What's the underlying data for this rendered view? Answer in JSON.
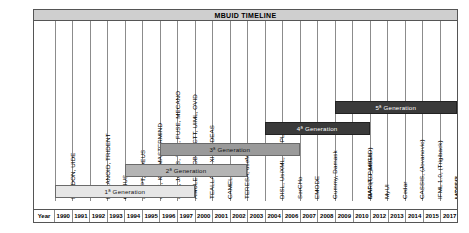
{
  "title": "MBUID TIMELINE",
  "axis": {
    "caption": "Year",
    "years": [
      "1990",
      "1991",
      "1992",
      "1993",
      "1994",
      "1995",
      "1996",
      "1997",
      "2000",
      "2001",
      "2002",
      "2003",
      "2004",
      "2006",
      "2007",
      "2008",
      "2009",
      "2010",
      "2012",
      "2013",
      "2014",
      "2015",
      "2017"
    ]
  },
  "chart_data": {
    "type": "table",
    "title": "MBUID TIMELINE",
    "xlabel": "Year",
    "ylabel": "",
    "grid": true,
    "legend_position": "none",
    "categories": [
      "1990",
      "1991",
      "1992",
      "1993",
      "1994",
      "1995",
      "1996",
      "1997",
      "2000",
      "2001",
      "2002",
      "2003",
      "2004",
      "2006",
      "2007",
      "2008",
      "2009",
      "2010",
      "2012",
      "2013",
      "2014",
      "2015",
      "2017"
    ],
    "entries": [
      {
        "year": "1990",
        "label": "ITS, DON, UIDE"
      },
      {
        "year": "1992",
        "label": "HUMANOID, TRIDENT"
      },
      {
        "year": "1993",
        "label": "GENIUS"
      },
      {
        "year": "1994",
        "label": "ADEPT, TADEUS"
      },
      {
        "year": "1995",
        "label": "AIDE, ICO, MASTERMIND"
      },
      {
        "year": "1996",
        "label": "AME, JANUS, TLIM, FUSE, MECANO"
      },
      {
        "year": "1997",
        "label": "AMULET, MOBI-D, CTT, UIML, OVID"
      },
      {
        "year": "2000",
        "label": "TEALLACH, XIML, IDEAS"
      },
      {
        "year": "2001",
        "label": "CAMELEON"
      },
      {
        "year": "2002",
        "label": "TERESA, useML"
      },
      {
        "year": "2004",
        "label": "DISL, UsiXML, SUPPLE"
      },
      {
        "year": "2006",
        "label": "SerCHo"
      },
      {
        "year": "2007",
        "label": "EMODE"
      },
      {
        "year": "2008",
        "label": "Gummy, Damask"
      },
      {
        "year": "2010",
        "label": "MARIA, PamGis"
      },
      {
        "year": "2012",
        "label": "OAF (TD_MBUID)"
      },
      {
        "year": "2013",
        "label": "MyUI"
      },
      {
        "year": "2014",
        "label": "Cedar"
      },
      {
        "year": "2015",
        "label": "CASSIS, (Jovanovic)"
      },
      {
        "year": "2015",
        "label": "IFML 1.0, (Trigiback)"
      },
      {
        "year": "2016",
        "label": "LIZARD"
      },
      {
        "year": "2017",
        "label": "MODUS"
      }
    ],
    "generations": [
      {
        "name": "1ª Generation",
        "start_year": "1990",
        "end_year": "1997",
        "shade": "light"
      },
      {
        "name": "2ª Generation",
        "start_year": "1994",
        "end_year": "1997",
        "shade": "mid"
      },
      {
        "name": "3ª Generation",
        "start_year": "1997",
        "end_year": "2003",
        "shade": "dark"
      },
      {
        "name": "4ª Generation",
        "start_year": "2003",
        "end_year": "2009",
        "shade": "black"
      },
      {
        "name": "5ª Generation",
        "start_year": "2009",
        "end_year": "2017",
        "shade": "black"
      }
    ]
  },
  "labels": [
    {
      "text": "ITS, DON, UIDE",
      "col": 0
    },
    {
      "text": "HUMANOID, TRIDENT",
      "col": 2
    },
    {
      "text": "GENIUS",
      "col": 3
    },
    {
      "text": "ADEPT, TADEUS",
      "col": 4
    },
    {
      "text": "AIDE, ICO, MASTERMIND",
      "col": 5
    },
    {
      "text": "AME, JANUS, TLIM, FUSE, MECANO",
      "col": 6
    },
    {
      "text": "AMULET, MOBI-D, CTT, UIML, OVID",
      "col": 7
    },
    {
      "text": "TEALLACH, XIML, IDEAS",
      "col": 9
    },
    {
      "text": "CAMELEON",
      "col": 10
    },
    {
      "text": "TERESA, useML",
      "col": 11
    },
    {
      "text": "DISL, UsiXML, SUPPLE",
      "col": 13
    },
    {
      "text": "SerCHo",
      "col": 14
    },
    {
      "text": "EMODE",
      "col": 15
    },
    {
      "text": "Gummy, Damask",
      "col": 16
    },
    {
      "text": "MARIA, PamGis",
      "col": 18
    },
    {
      "text": "OAF (TD_MBUID)",
      "col": 19
    },
    {
      "text": "MyUI",
      "col": 20
    },
    {
      "text": "Cedar",
      "col": 21
    },
    {
      "text": "CASSIS, (Jovanovic)",
      "col": 22
    },
    {
      "text": "IFML 1.0, (Trigiback)",
      "col": 23
    },
    {
      "text": "LIZARD",
      "col": 24
    },
    {
      "text": "MODUS",
      "col": 25
    }
  ],
  "generations": [
    {
      "text": "1ª Generation",
      "shade": "gen-light"
    },
    {
      "text": "2ª Generation",
      "shade": "gen-mid"
    },
    {
      "text": "3ª Generation",
      "shade": "gen-dark"
    },
    {
      "text": "4ª Generation",
      "shade": "gen-black"
    },
    {
      "text": "5ª Generation",
      "shade": "gen-black"
    }
  ]
}
